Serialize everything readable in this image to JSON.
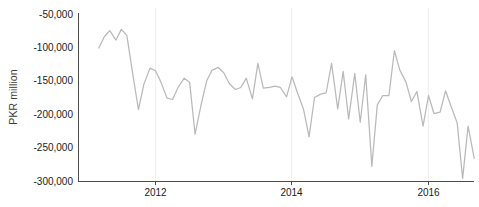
{
  "chart_data": {
    "type": "line",
    "title": "",
    "xlabel": "",
    "ylabel": "PKR million",
    "ylim": [
      -300000,
      -35000
    ],
    "xlim": [
      2011.0,
      2016.85
    ],
    "grid": "vertical-only",
    "legend": "none",
    "line_color": "#b9b9b9",
    "y_ticks": [
      -50000,
      -100000,
      -150000,
      -200000,
      -250000,
      -300000
    ],
    "y_tick_labels": [
      "-50,000",
      "-100,000",
      "-150,000",
      "-200,000",
      "-250,000",
      "-300,000"
    ],
    "x_ticks": [
      2012,
      2014,
      2016
    ],
    "x_tick_labels": [
      "2012",
      "2014",
      "2016"
    ],
    "series": [
      {
        "name": "Trade balance",
        "x": [
          2011.17,
          2011.25,
          2011.33,
          2011.42,
          2011.5,
          2011.58,
          2011.67,
          2011.75,
          2011.83,
          2011.92,
          2012.0,
          2012.08,
          2012.17,
          2012.25,
          2012.33,
          2012.42,
          2012.5,
          2012.58,
          2012.67,
          2012.75,
          2012.83,
          2012.92,
          2013.0,
          2013.08,
          2013.17,
          2013.25,
          2013.33,
          2013.42,
          2013.5,
          2013.58,
          2013.67,
          2013.75,
          2013.83,
          2013.92,
          2014.0,
          2014.08,
          2014.17,
          2014.25,
          2014.33,
          2014.42,
          2014.5,
          2014.58,
          2014.67,
          2014.75,
          2014.83,
          2014.92,
          2015.0,
          2015.08,
          2015.17,
          2015.25,
          2015.33,
          2015.42,
          2015.5,
          2015.58,
          2015.67,
          2015.75,
          2015.83,
          2015.92,
          2016.0,
          2016.08,
          2016.17,
          2016.25,
          2016.33,
          2016.42,
          2016.5,
          2016.58,
          2016.67
        ],
        "values": [
          -101000,
          -84000,
          -75000,
          -89000,
          -73000,
          -82000,
          -142000,
          -193000,
          -155000,
          -131000,
          -135000,
          -152000,
          -176000,
          -178000,
          -160000,
          -146000,
          -152000,
          -230000,
          -185000,
          -150000,
          -134000,
          -130000,
          -138000,
          -154000,
          -163000,
          -160000,
          -146000,
          -177000,
          -124000,
          -161000,
          -160000,
          -158000,
          -160000,
          -174000,
          -144000,
          -168000,
          -193000,
          -234000,
          -175000,
          -170000,
          -168000,
          -124000,
          -192000,
          -136000,
          -207000,
          -139000,
          -212000,
          -141000,
          -278000,
          -186000,
          -172000,
          -172000,
          -105000,
          -134000,
          -152000,
          -181000,
          -166000,
          -218000,
          -172000,
          -199000,
          -197000,
          -165000,
          -188000,
          -213000,
          -296000,
          -218000,
          -266000
        ]
      }
    ]
  },
  "axes": {
    "y_title": "PKR million"
  }
}
